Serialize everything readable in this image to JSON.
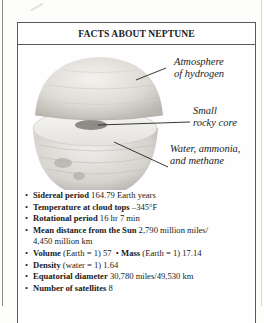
{
  "title": "FACTS ABOUT NEPTUNE",
  "diagram": {
    "labels": {
      "atmosphere": [
        "Atmosphere",
        "of hydrogen"
      ],
      "core": [
        "Small",
        "rocky core"
      ],
      "mantle": [
        "Water, ammonia,",
        "and methane"
      ]
    },
    "icon": "neptune-cutaway-illustration"
  },
  "facts": [
    {
      "label": "Sidereal period",
      "value": "164.79 Earth years"
    },
    {
      "label": "Temperature at cloud tops",
      "value": "–345°F"
    },
    {
      "label": "Rotational period",
      "value": "16 hr 7 min"
    },
    {
      "label": "Mean distance from the Sun",
      "value": "2,790 million miles/",
      "continuation": "4,450 million km"
    },
    {
      "label": "Volume",
      "value": "(Earth = 1) 57",
      "label2": "Mass",
      "value2": "(Earth = 1) 17.14"
    },
    {
      "label": "Density",
      "value": "(water = 1) 1.64"
    },
    {
      "label": "Equatorial diameter",
      "value": "30,780 miles/49,530 km"
    },
    {
      "label": "Number of satellites",
      "value": "8"
    }
  ]
}
